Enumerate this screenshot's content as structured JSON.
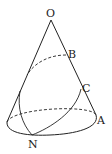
{
  "diagram": {
    "type": "cone-geometry",
    "labels": {
      "O": "O",
      "A": "A",
      "B": "B",
      "C": "C",
      "N": "N"
    },
    "stroke_color": "#222222"
  }
}
